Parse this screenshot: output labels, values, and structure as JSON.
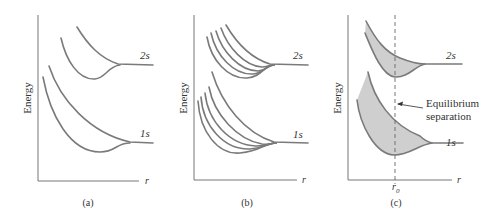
{
  "panels": [
    {
      "id": "a",
      "caption": "(a)",
      "ylabel": "Energy",
      "xlabel": "r",
      "levels": [
        {
          "label": "2s"
        },
        {
          "label": "1s"
        }
      ]
    },
    {
      "id": "b",
      "caption": "(b)",
      "ylabel": "Energy",
      "xlabel": "r",
      "levels": [
        {
          "label": "2s"
        },
        {
          "label": "1s"
        }
      ]
    },
    {
      "id": "c",
      "caption": "(c)",
      "ylabel": "Energy",
      "xlabel": "r",
      "xtick": "r",
      "xtick_sub": "0",
      "levels": [
        {
          "label": "2s"
        },
        {
          "label": "1s"
        }
      ],
      "annotation_line1": "Equilibrium",
      "annotation_line2": "separation"
    }
  ],
  "colors": {
    "curve": "#7a7a7a",
    "shade": "#cfcfcf",
    "axis": "#777777"
  }
}
